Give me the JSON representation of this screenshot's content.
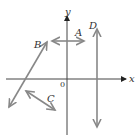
{
  "diagram": {
    "type": "coordinate-plane",
    "axes": {
      "x_label": "x",
      "y_label": "y",
      "origin_label": "0"
    },
    "lines": [
      {
        "label": "A",
        "orientation": "horizontal"
      },
      {
        "label": "B",
        "orientation": "positive-slope"
      },
      {
        "label": "C",
        "orientation": "negative-slope"
      },
      {
        "label": "D",
        "orientation": "vertical"
      }
    ],
    "colors": {
      "axis": "#444444",
      "line": "#888888"
    }
  }
}
